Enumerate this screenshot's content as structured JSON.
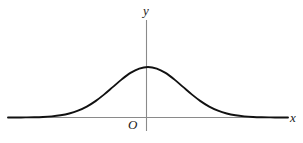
{
  "figure": {
    "background_color": "#ffffff",
    "width": 303,
    "height": 143
  },
  "labels": {
    "y_axis": "y",
    "x_axis": "x",
    "origin": "O"
  },
  "style": {
    "curve_color": "#111111",
    "curve_width": 1.9,
    "axis_color": "#8a8a8a",
    "axis_width": 1.1,
    "label_color": "#1a1a1a"
  },
  "chart_data": {
    "type": "line",
    "title": "",
    "subtitle": "",
    "xlabel": "x",
    "ylabel": "y",
    "origin_label": "O",
    "curve_name": "normal distribution density curve",
    "function": "bell curve (Gaussian), symmetric about x = 0",
    "mean": 0,
    "peak_at_x": 0,
    "grid": false,
    "legend": false,
    "legend_position": "none",
    "xlim": [
      -4,
      4
    ],
    "ylim": [
      0,
      1.15
    ],
    "axis_ticks": [],
    "x": [
      -4,
      -3.75,
      -3.5,
      -3.25,
      -3,
      -2.75,
      -2.5,
      -2.25,
      -2,
      -1.75,
      -1.5,
      -1.25,
      -1,
      -0.75,
      -0.5,
      -0.25,
      0,
      0.25,
      0.5,
      0.75,
      1,
      1.25,
      1.5,
      1.75,
      2,
      2.25,
      2.5,
      2.75,
      3,
      3.25,
      3.5,
      3.75,
      4
    ],
    "y": [
      0.0003,
      0.0009,
      0.0022,
      0.0051,
      0.0111,
      0.0228,
      0.0439,
      0.0796,
      0.1353,
      0.2163,
      0.3247,
      0.4578,
      0.6065,
      0.7548,
      0.8825,
      0.9692,
      1.0,
      0.9692,
      0.8825,
      0.7548,
      0.6065,
      0.4578,
      0.3247,
      0.2163,
      0.1353,
      0.0796,
      0.0439,
      0.0228,
      0.0111,
      0.0051,
      0.0022,
      0.0009,
      0.0003
    ],
    "annotations": [
      {
        "text": "y",
        "role": "vertical axis label",
        "position": "top of y-axis"
      },
      {
        "text": "x",
        "role": "horizontal axis label",
        "position": "right end of x-axis"
      },
      {
        "text": "O",
        "role": "origin label",
        "position": "below-left of origin"
      }
    ]
  }
}
